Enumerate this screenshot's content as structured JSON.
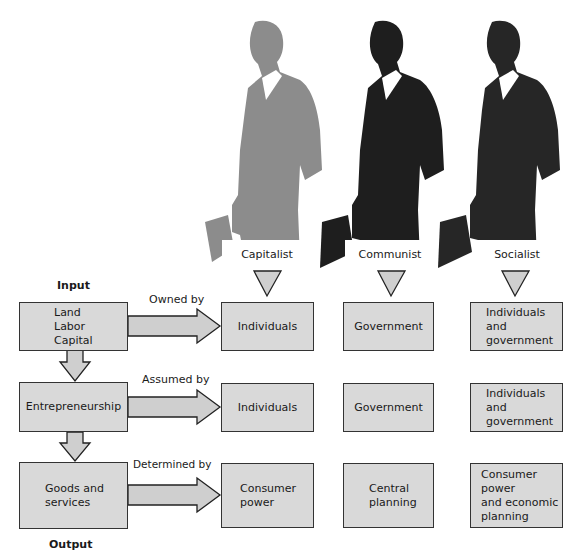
{
  "diagram": {
    "columns": [
      {
        "label": "Capitalist",
        "figure_color": "#8c8c8c"
      },
      {
        "label": "Communist",
        "figure_color": "#1e1e1e"
      },
      {
        "label": "Socialist",
        "figure_color": "#262626"
      }
    ],
    "input_label": "Input",
    "output_label": "Output",
    "rows": [
      {
        "factor": "Land\nLabor\nCapital",
        "relation": "Owned by",
        "capitalist": "Individuals",
        "communist": "Government",
        "socialist": "Individuals\nand\ngovernment"
      },
      {
        "factor": "Entrepreneurship",
        "relation": "Assumed by",
        "capitalist": "Individuals",
        "communist": "Government",
        "socialist": "Individuals\nand\ngovernment"
      },
      {
        "factor": "Goods and\nservices",
        "relation": "Determined by",
        "capitalist": "Consumer\npower",
        "communist": "Central\nplanning",
        "socialist": "Consumer\npower\nand economic\nplanning"
      }
    ],
    "colors": {
      "box_fill": "#d9d9d9",
      "box_border": "#333333",
      "arrow_fill": "#cfcfcf"
    }
  }
}
